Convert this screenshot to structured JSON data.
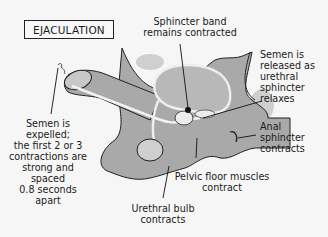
{
  "diagram": {
    "title": "EJACULATION",
    "colors": {
      "background": "#f6f6f6",
      "tissue": "#a9a9a9",
      "tissue_light": "#c8c8c8",
      "outline": "#222222"
    },
    "labels": [
      {
        "id": "sphincter-band",
        "text": "Sphincter band\nremains contracted"
      },
      {
        "id": "semen-released",
        "text": "Semen is\nreleased as\nurethral\nsphincter\nrelaxes"
      },
      {
        "id": "semen-expelled",
        "text": "Semen is\nexpelled;\nthe first 2 or 3\ncontractions are\nstrong and\nspaced\n0.8 seconds\napart"
      },
      {
        "id": "anal-sphincter",
        "text": "Anal\nsphincter\ncontracts"
      },
      {
        "id": "pelvic-floor",
        "text": "Pelvic floor muscles\ncontract"
      },
      {
        "id": "urethral-bulb",
        "text": "Urethral bulb\ncontracts"
      }
    ]
  }
}
